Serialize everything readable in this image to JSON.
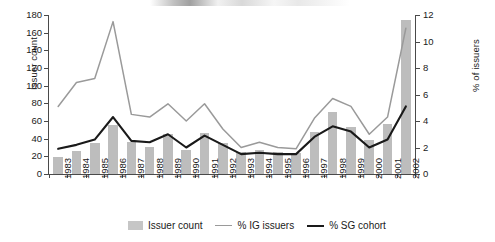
{
  "chart_data": {
    "type": "bar",
    "title": "",
    "xlabel": "",
    "ylabel": "Issuer count",
    "y2label": "% of issuers",
    "ylim": [
      0,
      180
    ],
    "y2lim": [
      0,
      12
    ],
    "ytick_step": 20,
    "y2tick_step": 2,
    "grid": false,
    "legend_position": "bottom",
    "categories": [
      "1983",
      "1984",
      "1985",
      "1986",
      "1987",
      "1988",
      "1989",
      "1990",
      "1991",
      "1992",
      "1993",
      "1994",
      "1995",
      "1996",
      "1997",
      "1998",
      "1999",
      "2000",
      "2001",
      "2002"
    ],
    "yticks": [
      "0",
      "20",
      "40",
      "60",
      "80",
      "100",
      "120",
      "140",
      "160",
      "180"
    ],
    "y2ticks": [
      "0",
      "2",
      "4",
      "6",
      "8",
      "10",
      "12"
    ],
    "series": [
      {
        "name": "Issuer count",
        "type": "bar",
        "axis": "left",
        "color": "#bdbdbd",
        "values": [
          19,
          26,
          35,
          56,
          36,
          31,
          45,
          27,
          46,
          35,
          25,
          27,
          25,
          24,
          47,
          70,
          53,
          38,
          57,
          174
        ]
      },
      {
        "name": "% IG issuers",
        "type": "line",
        "axis": "right",
        "color": "#9a9a9a",
        "values": [
          5.1,
          6.9,
          7.2,
          11.5,
          4.5,
          4.3,
          5.3,
          4.0,
          5.3,
          3.4,
          2.0,
          2.4,
          2.0,
          1.9,
          4.2,
          5.7,
          5.1,
          3.0,
          4.3,
          11.0
        ]
      },
      {
        "name": "% SG cohort",
        "type": "line",
        "axis": "right",
        "color": "#1a1a1a",
        "values": [
          1.9,
          2.2,
          2.6,
          4.3,
          2.5,
          2.4,
          3.0,
          2.0,
          2.9,
          2.2,
          1.5,
          1.6,
          1.5,
          1.5,
          2.8,
          3.6,
          3.2,
          2.0,
          2.6,
          5.1
        ]
      }
    ]
  },
  "legend": {
    "items": [
      {
        "label": "Issuer count",
        "marker": "bar-swatch"
      },
      {
        "label": "% IG issuers",
        "marker": "line-swatch-gray"
      },
      {
        "label": "% SG cohort",
        "marker": "line-swatch-black"
      }
    ]
  }
}
